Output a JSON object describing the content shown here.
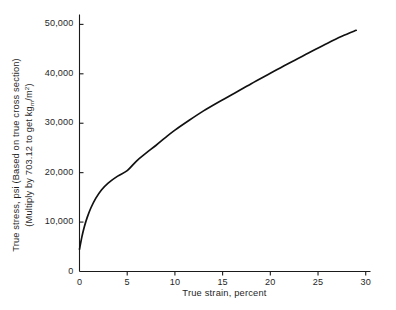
{
  "chart_data": {
    "type": "line",
    "title": "",
    "xlabel": "True strain, percent",
    "ylabel_line1": "True stress, psi (Based on true cross section)",
    "ylabel_line2_pre": "(Multiply by 703.12 to get kg",
    "ylabel_line2_sub": "m",
    "ylabel_line2_mid": "/m",
    "ylabel_line2_sup": "2",
    "ylabel_line2_post": ")",
    "xlim": [
      0,
      30.5
    ],
    "ylim": [
      0,
      52000
    ],
    "xticks": [
      "0",
      "5",
      "10",
      "15",
      "20",
      "25",
      "30"
    ],
    "xtick_values": [
      0,
      5,
      10,
      15,
      20,
      25,
      30
    ],
    "yticks": [
      "0",
      "10,000",
      "20,000",
      "30,000",
      "40,000",
      "50,000"
    ],
    "ytick_values": [
      0,
      10000,
      20000,
      30000,
      40000,
      50000
    ],
    "grid": false,
    "legend": "none",
    "series": [
      {
        "name": "True stress-strain curve",
        "color": "#111111",
        "x": [
          0.0,
          0.25,
          0.5,
          0.8,
          1.2,
          1.7,
          2.3,
          3.0,
          4.0,
          5.0,
          6.0,
          7.0,
          8.0,
          9.0,
          10.0,
          11.5,
          13.0,
          14.5,
          16.0,
          18.0,
          20.0,
          22.0,
          24.0,
          26.0,
          27.5,
          29.0
        ],
        "y": [
          4500,
          7000,
          9000,
          10900,
          12900,
          14800,
          16500,
          17900,
          19300,
          20400,
          22400,
          24000,
          25500,
          27100,
          28600,
          30600,
          32500,
          34200,
          35800,
          38000,
          40100,
          42200,
          44200,
          46200,
          47600,
          48800
        ]
      }
    ]
  },
  "axes": {
    "axis_color": "#1a1a1a",
    "tick_length": 4
  }
}
